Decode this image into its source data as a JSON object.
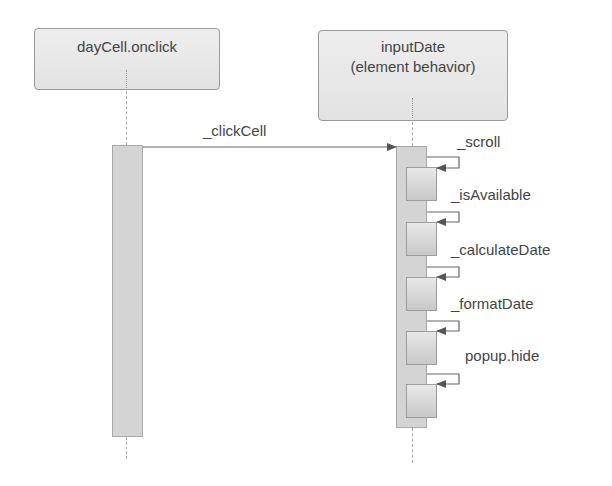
{
  "diagram": {
    "type": "sequence",
    "lifelines": [
      {
        "name": "dayCell.onclick"
      },
      {
        "name": "inputDate",
        "subtitle": "(element behavior)"
      }
    ],
    "messages": [
      {
        "from": "dayCell.onclick",
        "to": "inputDate",
        "label": "_clickCell"
      },
      {
        "from": "inputDate",
        "to": "inputDate",
        "label": "_scroll",
        "self": true
      },
      {
        "from": "inputDate",
        "to": "inputDate",
        "label": "_isAvailable",
        "self": true
      },
      {
        "from": "inputDate",
        "to": "inputDate",
        "label": "_calculateDate",
        "self": true
      },
      {
        "from": "inputDate",
        "to": "inputDate",
        "label": "_formatDate",
        "self": true
      },
      {
        "from": "inputDate",
        "to": "inputDate",
        "label": "popup.hide",
        "self": true
      }
    ]
  }
}
